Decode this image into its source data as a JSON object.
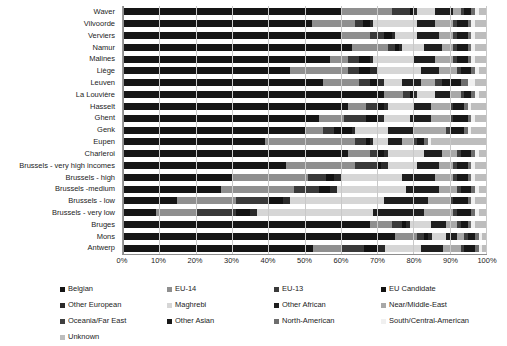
{
  "chart_data": {
    "type": "bar",
    "subtype": "stacked-horizontal-100-percent",
    "title": "",
    "xlabel": "",
    "ylabel": "",
    "xlim": [
      0,
      100
    ],
    "xticks": [
      "0%",
      "10%",
      "20%",
      "30%",
      "40%",
      "50%",
      "60%",
      "70%",
      "80%",
      "90%",
      "100%"
    ],
    "grid": true,
    "legend_position": "bottom",
    "categories": [
      "Waver",
      "Vilvoorde",
      "Verviers",
      "Namur",
      "Malines",
      "Liège",
      "Leuven",
      "La Louvière",
      "Hasselt",
      "Ghent",
      "Genk",
      "Eupen",
      "Charleroi",
      "Brussels - very high incomes",
      "Brussels - high",
      "Brussels -medium",
      "Brussels - low",
      "Brussels - very low",
      "Bruges",
      "Mons",
      "Antwerp"
    ],
    "series": [
      {
        "name": "Belgian",
        "color": "#151515",
        "values": [
          60.0,
          52.0,
          60.0,
          63.0,
          57.0,
          46.0,
          55.0,
          72.0,
          62.0,
          54.0,
          50.0,
          39.0,
          62.0,
          45.0,
          30.0,
          27.0,
          15.0,
          9.0,
          68.0,
          75.0,
          53.0
        ]
      },
      {
        "name": "EU-14",
        "color": "#8f8f8f",
        "values": [
          14.0,
          12.0,
          8.0,
          10.0,
          5.0,
          16.0,
          10.0,
          5.0,
          5.0,
          7.0,
          5.0,
          25.0,
          6.0,
          19.0,
          21.0,
          20.0,
          16.0,
          11.0,
          6.0,
          6.0,
          8.0
        ]
      },
      {
        "name": "EU-13",
        "color": "#3a3a3a",
        "values": [
          5.0,
          2.0,
          4.0,
          2.0,
          3.0,
          3.0,
          3.0,
          2.0,
          3.0,
          6.0,
          3.0,
          3.0,
          2.0,
          6.0,
          5.0,
          7.0,
          9.0,
          11.0,
          3.0,
          2.0,
          6.0
        ]
      },
      {
        "name": "EU Candidate",
        "color": "#121212",
        "values": [
          1.0,
          2.0,
          2.0,
          1.0,
          3.0,
          3.0,
          2.0,
          1.0,
          2.0,
          3.0,
          5.0,
          1.0,
          2.0,
          1.0,
          2.0,
          3.0,
          4.0,
          4.0,
          1.0,
          1.0,
          4.0
        ]
      },
      {
        "name": "Other European",
        "color": "#2b2b2b",
        "values": [
          1.0,
          1.0,
          1.0,
          1.0,
          1.0,
          2.0,
          2.0,
          1.0,
          1.0,
          2.0,
          1.0,
          1.0,
          1.0,
          2.0,
          2.0,
          2.0,
          2.0,
          2.0,
          1.0,
          1.0,
          2.0
        ]
      },
      {
        "name": "Maghrebi",
        "color": "#d6d6d6",
        "values": [
          5.0,
          12.0,
          6.0,
          6.0,
          11.0,
          12.0,
          5.0,
          5.0,
          7.0,
          7.0,
          9.0,
          4.0,
          10.0,
          8.0,
          17.0,
          19.0,
          26.0,
          32.0,
          6.0,
          4.0,
          10.0
        ]
      },
      {
        "name": "Other African",
        "color": "#1f1f1f",
        "values": [
          5.0,
          5.0,
          6.0,
          5.0,
          6.0,
          5.0,
          5.0,
          4.0,
          5.0,
          6.0,
          7.0,
          4.0,
          5.0,
          6.0,
          9.0,
          9.0,
          12.0,
          14.0,
          4.0,
          3.0,
          6.0
        ]
      },
      {
        "name": "Near/Middle-East",
        "color": "#a8a8a8",
        "values": [
          2.0,
          5.0,
          4.0,
          3.0,
          5.0,
          5.0,
          4.0,
          3.0,
          5.0,
          5.0,
          9.0,
          3.0,
          4.0,
          4.0,
          5.0,
          5.0,
          6.0,
          8.0,
          3.0,
          2.0,
          5.0
        ]
      },
      {
        "name": "Oceania/Far East",
        "color": "#3f3f3f",
        "values": [
          1.0,
          1.0,
          1.0,
          1.0,
          1.0,
          1.0,
          2.0,
          1.0,
          1.0,
          1.0,
          1.0,
          1.0,
          1.0,
          1.0,
          1.0,
          1.0,
          1.0,
          1.0,
          1.0,
          1.0,
          1.0
        ]
      },
      {
        "name": "Other Asian",
        "color": "#181818",
        "values": [
          2.0,
          3.0,
          3.0,
          3.0,
          3.0,
          3.0,
          5.0,
          2.0,
          3.0,
          4.0,
          4.0,
          2.0,
          3.0,
          3.0,
          3.0,
          3.0,
          4.0,
          4.0,
          2.0,
          2.0,
          3.0
        ]
      },
      {
        "name": "North-American",
        "color": "#6e6e6e",
        "values": [
          1.0,
          1.0,
          1.0,
          1.0,
          1.0,
          1.0,
          2.0,
          1.0,
          1.0,
          1.0,
          1.0,
          1.0,
          1.0,
          1.0,
          1.0,
          1.0,
          1.0,
          1.0,
          1.0,
          1.0,
          1.0
        ]
      },
      {
        "name": "South/Central-American",
        "color": "#f0f0f0",
        "values": [
          1.0,
          1.0,
          1.0,
          1.0,
          1.0,
          1.0,
          2.0,
          1.0,
          1.0,
          1.0,
          1.0,
          1.0,
          1.0,
          1.0,
          1.0,
          1.0,
          1.0,
          1.0,
          1.0,
          1.0,
          1.0
        ]
      },
      {
        "name": "Unknown",
        "color": "#bdbdbd",
        "values": [
          2.0,
          3.0,
          3.0,
          3.0,
          3.0,
          2.0,
          3.0,
          2.0,
          4.0,
          3.0,
          4.0,
          15.0,
          2.0,
          3.0,
          3.0,
          2.0,
          3.0,
          2.0,
          3.0,
          1.0,
          1.0
        ]
      }
    ]
  }
}
